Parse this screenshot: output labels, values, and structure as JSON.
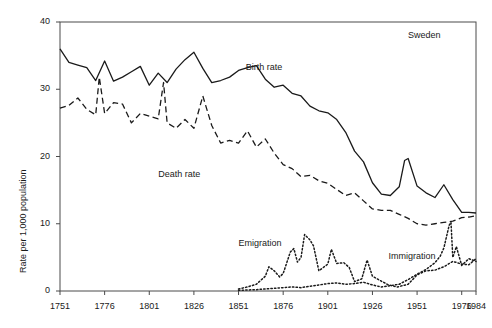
{
  "chart_data": {
    "type": "line",
    "title": "",
    "annotation_country": "Sweden",
    "xlabel": "",
    "ylabel": "Rate per 1,000 population",
    "xlim": [
      1751,
      1984
    ],
    "ylim": [
      0,
      40
    ],
    "grid": false,
    "legend_position": "inline-labels",
    "xticks": [
      1751,
      1776,
      1801,
      1826,
      1851,
      1876,
      1901,
      1926,
      1951,
      1976,
      1984
    ],
    "xtick_labels": [
      "1751",
      "1776",
      "1801",
      "1826",
      "1851",
      "1876",
      "1901",
      "1926",
      "1951",
      "1976",
      "1984"
    ],
    "yticks": [
      0,
      10,
      20,
      30,
      40
    ],
    "ytick_labels": [
      "0",
      "10",
      "20",
      "30",
      "40"
    ],
    "series": [
      {
        "name": "Birth rate",
        "style": "solid",
        "label_x": 1855,
        "label_y": 33.2,
        "x": [
          1751,
          1756,
          1761,
          1766,
          1771,
          1776,
          1781,
          1786,
          1791,
          1796,
          1801,
          1806,
          1811,
          1816,
          1821,
          1826,
          1831,
          1836,
          1841,
          1846,
          1851,
          1856,
          1861,
          1866,
          1871,
          1876,
          1881,
          1886,
          1891,
          1896,
          1901,
          1906,
          1911,
          1916,
          1921,
          1926,
          1931,
          1936,
          1941,
          1944,
          1946,
          1951,
          1956,
          1961,
          1966,
          1971,
          1976,
          1980,
          1984
        ],
        "values": [
          36.0,
          34.0,
          33.6,
          33.2,
          31.3,
          34.2,
          31.2,
          31.8,
          32.6,
          33.4,
          30.6,
          32.4,
          31.0,
          33.0,
          34.4,
          35.5,
          33.1,
          31.0,
          31.3,
          31.8,
          32.8,
          33.2,
          33.5,
          31.5,
          30.3,
          30.6,
          29.4,
          29.0,
          27.5,
          26.8,
          26.5,
          25.5,
          23.6,
          20.8,
          19.2,
          16.1,
          14.4,
          14.2,
          15.5,
          19.4,
          19.7,
          15.6,
          14.6,
          13.9,
          15.8,
          13.6,
          11.7,
          11.7,
          11.6
        ]
      },
      {
        "name": "Death rate",
        "style": "dashed",
        "label_x": 1806,
        "label_y": 17.2,
        "x": [
          1751,
          1756,
          1761,
          1766,
          1771,
          1773,
          1776,
          1781,
          1786,
          1791,
          1796,
          1801,
          1806,
          1809,
          1811,
          1816,
          1821,
          1826,
          1831,
          1836,
          1841,
          1846,
          1851,
          1856,
          1861,
          1866,
          1871,
          1876,
          1881,
          1886,
          1891,
          1896,
          1901,
          1906,
          1911,
          1916,
          1921,
          1926,
          1931,
          1936,
          1941,
          1946,
          1951,
          1956,
          1961,
          1966,
          1971,
          1976,
          1980,
          1984
        ],
        "values": [
          27.2,
          27.6,
          28.7,
          27.0,
          26.2,
          31.8,
          26.4,
          28.0,
          27.8,
          25.0,
          26.4,
          26.0,
          25.6,
          31.0,
          25.0,
          24.2,
          25.5,
          24.2,
          29.0,
          24.6,
          22.0,
          22.4,
          22.0,
          23.8,
          21.4,
          22.6,
          20.5,
          18.8,
          18.2,
          17.0,
          17.2,
          16.4,
          16.0,
          15.1,
          14.2,
          14.6,
          13.4,
          12.2,
          12.0,
          12.0,
          11.4,
          10.8,
          10.0,
          9.8,
          10.0,
          10.2,
          10.4,
          10.9,
          11.0,
          11.2
        ]
      },
      {
        "name": "Emigration",
        "style": "dotted",
        "label_x": 1851,
        "label_y": 7.0,
        "x": [
          1851,
          1856,
          1861,
          1866,
          1868,
          1871,
          1874,
          1876,
          1880,
          1882,
          1884,
          1886,
          1888,
          1891,
          1893,
          1896,
          1901,
          1903,
          1906,
          1910,
          1913,
          1916,
          1920,
          1923,
          1926,
          1930,
          1935,
          1940,
          1946,
          1951,
          1956,
          1961,
          1966,
          1971,
          1976,
          1980,
          1984
        ],
        "values": [
          0.3,
          0.6,
          1.0,
          2.2,
          3.6,
          3.0,
          2.1,
          2.6,
          5.8,
          6.3,
          4.3,
          5.0,
          8.4,
          7.6,
          6.7,
          3.0,
          4.0,
          6.2,
          4.1,
          4.2,
          3.5,
          1.4,
          1.8,
          4.6,
          2.2,
          1.6,
          0.9,
          0.6,
          1.0,
          2.4,
          3.0,
          3.1,
          3.6,
          4.4,
          4.0,
          3.9,
          4.8
        ]
      },
      {
        "name": "Immigration",
        "style": "dotted",
        "label_x": 1935,
        "label_y": 5.0,
        "x": [
          1851,
          1861,
          1871,
          1876,
          1881,
          1886,
          1891,
          1896,
          1901,
          1906,
          1911,
          1916,
          1921,
          1926,
          1931,
          1936,
          1941,
          1946,
          1951,
          1956,
          1961,
          1964,
          1966,
          1969,
          1970,
          1971,
          1973,
          1976,
          1980,
          1984
        ],
        "values": [
          0.1,
          0.2,
          0.4,
          0.5,
          0.6,
          0.5,
          0.7,
          0.9,
          1.1,
          1.2,
          1.0,
          1.1,
          1.3,
          0.9,
          0.6,
          0.8,
          1.0,
          1.7,
          2.5,
          3.2,
          4.2,
          5.2,
          6.4,
          9.8,
          10.2,
          5.0,
          6.6,
          3.8,
          4.8,
          4.4
        ]
      }
    ]
  },
  "layout": {
    "plot_left": 60,
    "plot_right": 476,
    "plot_top": 22,
    "plot_bottom": 291
  },
  "colors": {
    "line": "#1a1a1a",
    "axis": "#4a4a4a",
    "background": "#ffffff",
    "text": "#1a1a1a"
  }
}
